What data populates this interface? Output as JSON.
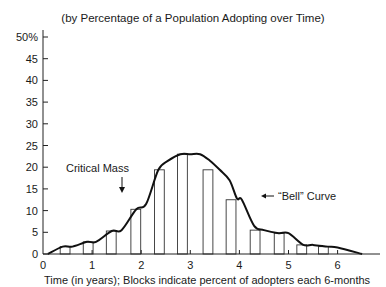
{
  "chart_data": {
    "type": "bar",
    "title": "(by Percentage of a Population Adopting over Time)",
    "xlabel": "Time (in years); Blocks indicate percent of adopters each 6-months",
    "ylabel": "",
    "x_ticks": [
      0,
      1,
      2,
      3,
      4,
      5,
      6
    ],
    "y_ticks": [
      0,
      5,
      10,
      15,
      20,
      25,
      30,
      35,
      40,
      45,
      50
    ],
    "y_tick_labels": [
      "0",
      "5",
      "10",
      "15",
      "20",
      "25",
      "30",
      "35",
      "40",
      "45",
      "50%"
    ],
    "xlim": [
      0,
      6.7
    ],
    "ylim": [
      0,
      50
    ],
    "grid": false,
    "legend": null,
    "bars": {
      "x_centers": [
        0.45,
        0.92,
        1.39,
        1.89,
        2.37,
        2.84,
        3.36,
        3.83,
        4.32,
        4.81,
        5.27,
        5.71
      ],
      "width_years": 0.2,
      "values": [
        1.7,
        2.8,
        5.3,
        10.3,
        19.4,
        23,
        19.4,
        12.5,
        5.5,
        4.8,
        2.1,
        1.7
      ]
    },
    "curve": {
      "name": "Bell Curve",
      "x": [
        0.1,
        0.4,
        0.6,
        0.9,
        1.08,
        1.4,
        1.6,
        1.9,
        2.1,
        2.35,
        2.55,
        2.8,
        3.0,
        3.2,
        3.4,
        3.6,
        3.8,
        3.95,
        4.05,
        4.3,
        4.5,
        4.8,
        5.0,
        5.3,
        5.5,
        5.8,
        6.0,
        6.5
      ],
      "y": [
        0,
        1.7,
        1.7,
        2.8,
        2.8,
        5.3,
        5.5,
        10.3,
        11.5,
        19.4,
        21.5,
        23,
        23,
        23,
        21.5,
        19.4,
        17,
        12.8,
        12.5,
        6.5,
        5.5,
        4.8,
        4.8,
        2.1,
        2.1,
        1.7,
        1.5,
        0
      ]
    },
    "annotations": [
      {
        "text": "Critical Mass",
        "arrow": "down",
        "x": 1.62,
        "y": 14.5
      },
      {
        "text": "“Bell” Curve",
        "arrow": "left",
        "x": 4.5,
        "y": 13.5
      }
    ]
  }
}
